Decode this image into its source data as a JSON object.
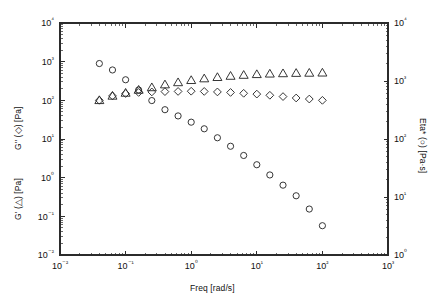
{
  "chart_data": {
    "type": "scatter",
    "title": "",
    "xlabel": "Freq [rad/s]",
    "ylabel_left_primary": "G'' (◇) [Pa]",
    "ylabel_left_secondary": "G' (△) [Pa]",
    "ylabel_right": "Eta* (○) [Pa·s]",
    "xscale": "log",
    "yscale": "log",
    "xlim": [
      0.01,
      1000
    ],
    "ylim_left": [
      0.01,
      10000
    ],
    "ylim_right": [
      1,
      10000
    ],
    "grid": false,
    "legend": "none",
    "xticks": [
      "10⁻²",
      "10⁻¹",
      "10⁰",
      "10¹",
      "10²",
      "10³"
    ],
    "xtick_values": [
      0.01,
      0.1,
      1,
      10,
      100,
      1000
    ],
    "yticks_left": [
      "10⁻²",
      "10⁻¹",
      "10⁰",
      "10¹",
      "10²",
      "10³",
      "10⁴"
    ],
    "ytick_values_left": [
      0.01,
      0.1,
      1,
      10,
      100,
      1000,
      10000
    ],
    "yticks_right": [
      "10⁰",
      "10¹",
      "10²",
      "10³",
      "10⁴"
    ],
    "ytick_values_right": [
      1,
      10,
      100,
      1000,
      10000
    ],
    "series": [
      {
        "name": "Eta* (○) [Pa·s]",
        "marker": "circle",
        "axis": "right",
        "x": [
          0.0398,
          0.0631,
          0.1,
          0.158,
          0.251,
          0.398,
          0.631,
          1.0,
          1.58,
          2.51,
          3.98,
          6.31,
          10.0,
          15.8,
          25.1,
          39.8,
          63.1,
          100.0
        ],
        "y": [
          2000,
          1550,
          1050,
          700,
          460,
          320,
          250,
          195,
          150,
          105,
          75,
          52,
          36,
          24,
          16,
          10.5,
          6.2,
          3.2
        ]
      },
      {
        "name": "G' (△) [Pa]",
        "marker": "triangle",
        "axis": "left",
        "x": [
          0.0398,
          0.0631,
          0.1,
          0.158,
          0.251,
          0.398,
          0.631,
          1.0,
          1.58,
          2.51,
          3.98,
          6.31,
          10.0,
          15.8,
          25.1,
          39.8,
          63.1,
          100.0
        ],
        "y": [
          100,
          130,
          155,
          185,
          215,
          255,
          290,
          330,
          365,
          395,
          425,
          450,
          470,
          485,
          495,
          505,
          510,
          515
        ]
      },
      {
        "name": "G'' (◇) [Pa]",
        "marker": "diamond",
        "axis": "left",
        "x": [
          0.0398,
          0.0631,
          0.1,
          0.158,
          0.251,
          0.398,
          0.631,
          1.0,
          1.58,
          2.51,
          3.98,
          6.31,
          10.0,
          15.8,
          25.1,
          39.8,
          63.1,
          100.0
        ],
        "y": [
          100,
          130,
          150,
          160,
          165,
          168,
          170,
          172,
          170,
          165,
          160,
          152,
          145,
          135,
          125,
          115,
          108,
          100
        ]
      }
    ]
  }
}
